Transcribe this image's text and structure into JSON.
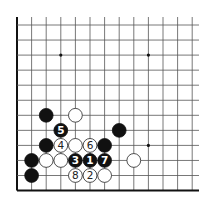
{
  "diagram": {
    "type": "go-board-diagram",
    "board": {
      "columns": 13,
      "rows": 12,
      "edges_shown": [
        "left",
        "bottom"
      ],
      "grid_origin_x": 17,
      "grid_origin_y": 25,
      "col_spacing": 14.6,
      "row_spacing": 15.05,
      "line_color": "#555555",
      "edge_color": "#111111",
      "background": "#ffffff"
    },
    "hoshi": [
      {
        "col": 3,
        "row": 2
      },
      {
        "col": 9,
        "row": 2
      },
      {
        "col": 9,
        "row": 8
      }
    ],
    "stones": [
      {
        "color": "black",
        "col": 2,
        "row": 6,
        "label": ""
      },
      {
        "color": "white",
        "col": 4,
        "row": 6,
        "label": ""
      },
      {
        "color": "black",
        "col": 3,
        "row": 7,
        "label": "5"
      },
      {
        "color": "black",
        "col": 7,
        "row": 7,
        "label": ""
      },
      {
        "color": "black",
        "col": 2,
        "row": 8,
        "label": ""
      },
      {
        "color": "white",
        "col": 3,
        "row": 8,
        "label": "4"
      },
      {
        "color": "white",
        "col": 4,
        "row": 8,
        "label": ""
      },
      {
        "color": "white",
        "col": 5,
        "row": 8,
        "label": "6"
      },
      {
        "color": "black",
        "col": 6,
        "row": 8,
        "label": ""
      },
      {
        "color": "black",
        "col": 1,
        "row": 9,
        "label": ""
      },
      {
        "color": "white",
        "col": 2,
        "row": 9,
        "label": ""
      },
      {
        "color": "white",
        "col": 3,
        "row": 9,
        "label": ""
      },
      {
        "color": "black",
        "col": 4,
        "row": 9,
        "label": "3"
      },
      {
        "color": "black",
        "col": 5,
        "row": 9,
        "label": "1"
      },
      {
        "color": "black",
        "col": 6,
        "row": 9,
        "label": "7"
      },
      {
        "color": "white",
        "col": 8,
        "row": 9,
        "label": ""
      },
      {
        "color": "black",
        "col": 1,
        "row": 10,
        "label": ""
      },
      {
        "color": "white",
        "col": 4,
        "row": 10,
        "label": "8"
      },
      {
        "color": "white",
        "col": 5,
        "row": 10,
        "label": "2"
      },
      {
        "color": "white",
        "col": 6,
        "row": 10,
        "label": ""
      }
    ],
    "colors": {
      "black_stone": "#111111",
      "white_stone": "#ffffff",
      "white_stone_border": "#222222",
      "label_on_black": "#ffffff",
      "label_on_white": "#222222"
    }
  }
}
